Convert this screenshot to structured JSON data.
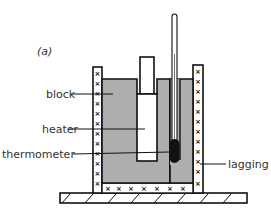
{
  "figure": {
    "panel_label": "(a)",
    "labels": {
      "block": "block",
      "heater": "heater",
      "thermometer": "thermometer",
      "lagging": "lagging"
    },
    "lagging_mark": "×"
  },
  "colors": {
    "block_fill": "#aeaeae",
    "outline": "#111111",
    "lagging_fill": "#ffffff",
    "bulb": "#111111",
    "text": "#333333"
  }
}
